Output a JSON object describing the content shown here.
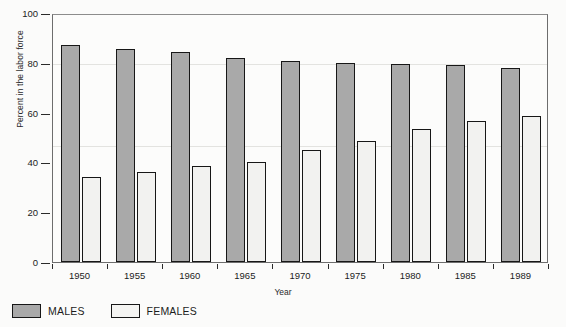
{
  "chart_data": {
    "type": "bar",
    "title": "",
    "xlabel": "Year",
    "ylabel": "Percent in the labor force",
    "categories": [
      "1950",
      "1955",
      "1960",
      "1965",
      "1970",
      "1975",
      "1980",
      "1985",
      "1989"
    ],
    "series": [
      {
        "name": "MALES",
        "color": "#a9a9a9",
        "values": [
          87.0,
          85.5,
          84.5,
          82.0,
          80.8,
          80.0,
          79.5,
          79.0,
          78.0
        ]
      },
      {
        "name": "FEMALES",
        "color": "#f2f2f0",
        "values": [
          34.0,
          36.0,
          38.5,
          40.0,
          45.0,
          48.5,
          53.5,
          56.5,
          58.5
        ]
      }
    ],
    "ylim": [
      0,
      100
    ],
    "yticks": [
      "0",
      "20",
      "40",
      "60",
      "80",
      "100"
    ],
    "ytick_values": [
      0,
      20,
      40,
      60,
      80,
      100
    ],
    "grid": false,
    "legend_position": "below-left"
  },
  "legend": {
    "items": [
      {
        "label": "MALES",
        "swatch": "male-swatch"
      },
      {
        "label": "FEMALES",
        "swatch": "female-swatch"
      }
    ]
  }
}
